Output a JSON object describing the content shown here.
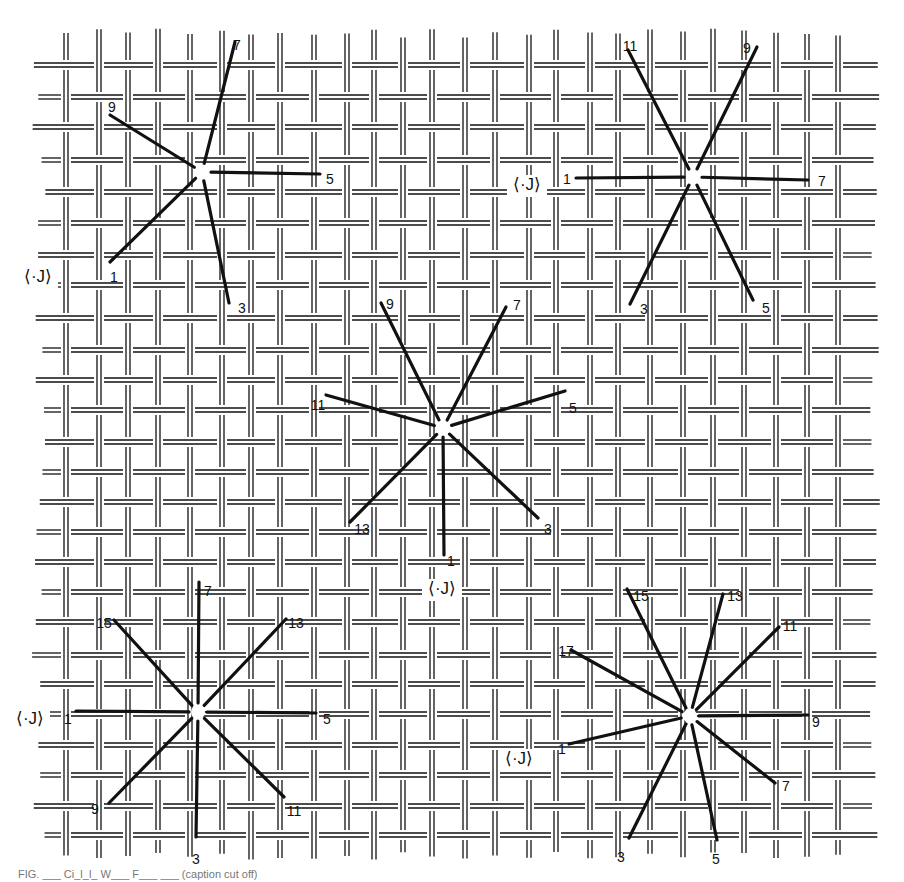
{
  "figure": {
    "type": "crossed-fabric weave diagram with star-shaped yarn intersections",
    "background": "#ffffff",
    "ink": "#111111",
    "grid": {
      "columns_x": [
        66,
        99,
        128,
        158,
        190,
        222,
        251,
        280,
        314,
        347,
        374,
        403,
        432,
        465,
        495,
        529,
        556,
        590,
        618,
        650,
        683,
        713,
        744,
        776,
        807,
        838
      ],
      "rows_y": [
        65,
        97,
        127,
        160,
        192,
        223,
        255,
        285,
        318,
        350,
        380,
        410,
        442,
        472,
        502,
        532,
        562,
        592,
        622,
        655,
        684,
        714,
        745,
        775,
        806,
        835
      ],
      "x_start": 32,
      "x_end": 880,
      "y_start": 28,
      "y_end": 860
    },
    "stars": [
      {
        "id": "star-top-left",
        "center": [
          202,
          172
        ],
        "marker": "⟨·J⟩",
        "marker_pos": [
          38,
          278
        ],
        "rays": [
          {
            "label": "1",
            "end": [
              110,
              262
            ],
            "label_pos": [
              114,
              278
            ]
          },
          {
            "label": "3",
            "end": [
              229,
              303
            ],
            "label_pos": [
              242,
              309
            ]
          },
          {
            "label": "5",
            "end": [
              320,
              174
            ],
            "label_pos": [
              330,
              180
            ]
          },
          {
            "label": "7",
            "end": [
              235,
              42
            ],
            "label_pos": [
              237,
              46
            ]
          },
          {
            "label": "9",
            "end": [
              110,
              115
            ],
            "label_pos": [
              112,
              108
            ]
          }
        ]
      },
      {
        "id": "star-top-right",
        "center": [
          693,
          177
        ],
        "marker": "⟨·J⟩",
        "marker_pos": [
          527,
          186
        ],
        "rays": [
          {
            "label": "1",
            "end": [
              576,
              178
            ],
            "label_pos": [
              567,
              180
            ]
          },
          {
            "label": "3",
            "end": [
              630,
              304
            ],
            "label_pos": [
              644,
              310
            ]
          },
          {
            "label": "5",
            "end": [
              753,
              300
            ],
            "label_pos": [
              766,
              309
            ]
          },
          {
            "label": "7",
            "end": [
              808,
              180
            ],
            "label_pos": [
              822,
              182
            ]
          },
          {
            "label": "9",
            "end": [
              757,
              47
            ],
            "label_pos": [
              747,
              49
            ]
          },
          {
            "label": "11",
            "end": [
              628,
              50
            ],
            "label_pos": [
              630,
              47
            ]
          }
        ]
      },
      {
        "id": "star-center",
        "center": [
          443,
          428
        ],
        "marker": "⟨·J⟩",
        "marker_pos": [
          442,
          590
        ],
        "rays": [
          {
            "label": "1",
            "end": [
              444,
              555
            ],
            "label_pos": [
              451,
              562
            ]
          },
          {
            "label": "3",
            "end": [
              538,
              518
            ],
            "label_pos": [
              548,
              530
            ]
          },
          {
            "label": "5",
            "end": [
              565,
              391
            ],
            "label_pos": [
              573,
              409
            ]
          },
          {
            "label": "7",
            "end": [
              506,
              307
            ],
            "label_pos": [
              517,
              306
            ]
          },
          {
            "label": "9",
            "end": [
              381,
              303
            ],
            "label_pos": [
              390,
              305
            ]
          },
          {
            "label": "11",
            "end": [
              326,
              395
            ],
            "label_pos": [
              318,
              406
            ]
          },
          {
            "label": "13",
            "end": [
              350,
              522
            ],
            "label_pos": [
              362,
              530
            ]
          }
        ]
      },
      {
        "id": "star-bottom-left",
        "center": [
          198,
          712
        ],
        "marker": "⟨·J⟩",
        "marker_pos": [
          30,
          720
        ],
        "rays": [
          {
            "label": "1",
            "end": [
              76,
              711
            ],
            "label_pos": [
              68,
              720
            ]
          },
          {
            "label": "3",
            "end": [
              196,
              837
            ],
            "label_pos": [
              196,
              860
            ]
          },
          {
            "label": "5",
            "end": [
              316,
              713
            ],
            "label_pos": [
              327,
              720
            ]
          },
          {
            "label": "7",
            "end": [
              199,
              582
            ],
            "label_pos": [
              208,
              592
            ]
          },
          {
            "label": "9",
            "end": [
              109,
              803
            ],
            "label_pos": [
              95,
              810
            ]
          },
          {
            "label": "11",
            "end": [
              284,
              797
            ],
            "label_pos": [
              294,
              812
            ]
          },
          {
            "label": "13",
            "end": [
              286,
              619
            ],
            "label_pos": [
              296,
              624
            ]
          },
          {
            "label": "15",
            "end": [
              114,
              620
            ],
            "label_pos": [
              104,
              624
            ]
          }
        ]
      },
      {
        "id": "star-bottom-right",
        "center": [
          690,
          716
        ],
        "marker": "⟨·J⟩",
        "marker_pos": [
          519,
          760
        ],
        "rays": [
          {
            "label": "1",
            "end": [
              569,
              744
            ],
            "label_pos": [
              562,
              750
            ]
          },
          {
            "label": "3",
            "end": [
              629,
              838
            ],
            "label_pos": [
              621,
              858
            ]
          },
          {
            "label": "5",
            "end": [
              717,
              840
            ],
            "label_pos": [
              716,
              860
            ]
          },
          {
            "label": "7",
            "end": [
              775,
              783
            ],
            "label_pos": [
              786,
              787
            ]
          },
          {
            "label": "9",
            "end": [
              808,
              715
            ],
            "label_pos": [
              816,
              723
            ]
          },
          {
            "label": "11",
            "end": [
              779,
              627
            ],
            "label_pos": [
              790,
              627
            ]
          },
          {
            "label": "13",
            "end": [
              723,
              594
            ],
            "label_pos": [
              735,
              597
            ]
          },
          {
            "label": "15",
            "end": [
              627,
              589
            ],
            "label_pos": [
              641,
              597
            ]
          },
          {
            "label": "17",
            "end": [
              571,
              650
            ],
            "label_pos": [
              566,
              652
            ]
          }
        ]
      }
    ],
    "caption": "FIG. ___  Ci_l_l_  W___  F___ ___ (caption cut off)"
  }
}
